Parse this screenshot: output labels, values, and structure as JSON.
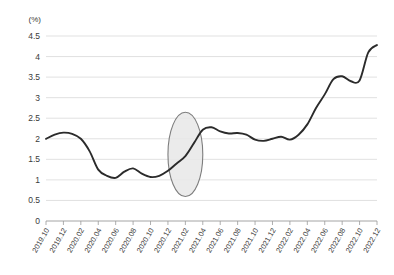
{
  "chart_data": {
    "type": "line",
    "title": "",
    "subtitle": "",
    "xlabel": "",
    "ylabel": "",
    "unit_label": "(%)",
    "ylim": [
      0,
      4.5
    ],
    "yticks": [
      "0",
      "0.5",
      "1",
      "1.5",
      "2",
      "2.5",
      "3",
      "3.5",
      "4",
      "4.5"
    ],
    "ytick_values": [
      0,
      0.5,
      1,
      1.5,
      2,
      2.5,
      3,
      3.5,
      4,
      4.5
    ],
    "grid": true,
    "legend": "none",
    "xtick_labels": [
      "2019.10",
      "2019.12",
      "2020.02",
      "2020.04",
      "2020.06",
      "2020.08",
      "2020.10",
      "2020.12",
      "2021.02",
      "2021.04",
      "2021.06",
      "2021.08",
      "2021.10",
      "2021.12",
      "2022.02",
      "2022.04",
      "2022.06",
      "2022.08",
      "2022.10",
      "2022.12"
    ],
    "x": [
      "2019.10",
      "2019.11",
      "2019.12",
      "2020.01",
      "2020.02",
      "2020.03",
      "2020.04",
      "2020.05",
      "2020.06",
      "2020.07",
      "2020.08",
      "2020.09",
      "2020.10",
      "2020.11",
      "2020.12",
      "2021.01",
      "2021.02",
      "2021.03",
      "2021.04",
      "2021.05",
      "2021.06",
      "2021.07",
      "2021.08",
      "2021.09",
      "2021.10",
      "2021.11",
      "2021.12",
      "2022.01",
      "2022.02",
      "2022.03",
      "2022.04",
      "2022.05",
      "2022.06",
      "2022.07",
      "2022.08",
      "2022.09",
      "2022.10",
      "2022.11",
      "2022.12"
    ],
    "values": [
      2.0,
      2.1,
      2.15,
      2.12,
      2.0,
      1.7,
      1.25,
      1.1,
      1.05,
      1.2,
      1.28,
      1.15,
      1.07,
      1.1,
      1.22,
      1.4,
      1.58,
      1.9,
      2.22,
      2.28,
      2.18,
      2.13,
      2.14,
      2.1,
      1.98,
      1.95,
      2.0,
      2.05,
      1.98,
      2.1,
      2.35,
      2.75,
      3.08,
      3.45,
      3.52,
      3.4,
      3.42,
      4.1,
      4.28
    ],
    "series_color": "#2b2b2b",
    "grid_color": "#d9d9d9",
    "axis_color": "#9a9a9a",
    "annotations": [
      {
        "name": "highlight-ellipse",
        "shape": "ellipse",
        "x_center": "2021.02",
        "x_range": [
          "2020.12",
          "2021.04"
        ],
        "y_center": 1.62,
        "y_range": [
          0.6,
          2.65
        ],
        "fill": "#e8e8e8",
        "stroke": "#7d7d7d"
      }
    ]
  }
}
